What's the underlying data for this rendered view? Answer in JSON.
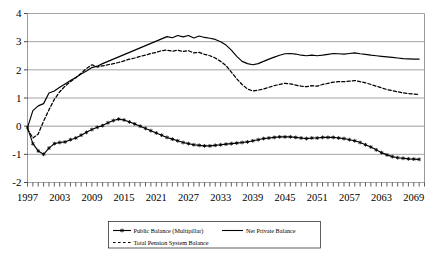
{
  "chart_data": {
    "type": "line",
    "title": "",
    "subtitle": "",
    "xlabel": "",
    "ylabel": "",
    "xlim": [
      1997,
      2071
    ],
    "ylim": [
      -2,
      4
    ],
    "yticks": [
      -2,
      -1,
      0,
      1,
      2,
      3,
      4
    ],
    "ytick_labels": [
      "-2",
      "-1",
      "0",
      "1",
      "2",
      "3",
      "4"
    ],
    "xticks": [
      1997,
      2003,
      2009,
      2015,
      2021,
      2027,
      2033,
      2039,
      2045,
      2051,
      2057,
      2063,
      2069
    ],
    "xtick_labels": [
      "1997",
      "2003",
      "2009",
      "2015",
      "2021",
      "2027",
      "2033",
      "2039",
      "2045",
      "2051",
      "2057",
      "2063",
      "2069"
    ],
    "minor_xticks_every": 1,
    "grid": true,
    "gridlines": "horizontal",
    "legend_position": "bottom",
    "x": [
      1997,
      1998,
      1999,
      2000,
      2001,
      2002,
      2003,
      2004,
      2005,
      2006,
      2007,
      2008,
      2009,
      2010,
      2011,
      2012,
      2013,
      2014,
      2015,
      2016,
      2017,
      2018,
      2019,
      2020,
      2021,
      2022,
      2023,
      2024,
      2025,
      2026,
      2027,
      2028,
      2029,
      2030,
      2031,
      2032,
      2033,
      2034,
      2035,
      2036,
      2037,
      2038,
      2039,
      2040,
      2041,
      2042,
      2043,
      2044,
      2045,
      2046,
      2047,
      2048,
      2049,
      2050,
      2051,
      2052,
      2053,
      2054,
      2055,
      2056,
      2057,
      2058,
      2059,
      2060,
      2061,
      2062,
      2063,
      2064,
      2065,
      2066,
      2067,
      2068,
      2069,
      2070
    ],
    "series": [
      {
        "name": "Net Private Balance",
        "style": "solid",
        "marker": "none",
        "color": "#000000",
        "values": [
          -0.05,
          0.55,
          0.72,
          0.8,
          1.18,
          1.25,
          1.38,
          1.5,
          1.62,
          1.73,
          1.85,
          1.96,
          2.08,
          2.13,
          2.22,
          2.3,
          2.38,
          2.46,
          2.54,
          2.62,
          2.7,
          2.78,
          2.86,
          2.94,
          3.02,
          3.1,
          3.18,
          3.14,
          3.22,
          3.17,
          3.22,
          3.13,
          3.2,
          3.15,
          3.12,
          3.08,
          3.0,
          2.88,
          2.7,
          2.48,
          2.3,
          2.22,
          2.18,
          2.22,
          2.3,
          2.38,
          2.45,
          2.52,
          2.57,
          2.58,
          2.56,
          2.52,
          2.5,
          2.52,
          2.5,
          2.52,
          2.55,
          2.58,
          2.57,
          2.56,
          2.58,
          2.6,
          2.57,
          2.55,
          2.52,
          2.5,
          2.48,
          2.46,
          2.44,
          2.42,
          2.4,
          2.39,
          2.38,
          2.38
        ]
      },
      {
        "name": "Total Pension System Balance",
        "style": "dashed",
        "marker": "none",
        "color": "#000000",
        "values": [
          -0.1,
          -0.42,
          -0.28,
          0.18,
          0.58,
          0.95,
          1.22,
          1.42,
          1.58,
          1.72,
          1.88,
          2.05,
          2.18,
          2.1,
          2.14,
          2.18,
          2.22,
          2.26,
          2.32,
          2.38,
          2.42,
          2.48,
          2.52,
          2.58,
          2.62,
          2.68,
          2.7,
          2.66,
          2.7,
          2.65,
          2.68,
          2.6,
          2.62,
          2.55,
          2.5,
          2.42,
          2.3,
          2.15,
          1.92,
          1.68,
          1.48,
          1.32,
          1.25,
          1.28,
          1.32,
          1.38,
          1.44,
          1.48,
          1.52,
          1.5,
          1.46,
          1.42,
          1.4,
          1.44,
          1.42,
          1.48,
          1.52,
          1.56,
          1.58,
          1.58,
          1.6,
          1.62,
          1.58,
          1.54,
          1.48,
          1.42,
          1.36,
          1.3,
          1.26,
          1.22,
          1.18,
          1.16,
          1.14,
          1.12
        ]
      },
      {
        "name": "Public Balance (Multipillar)",
        "style": "solid",
        "marker": "star",
        "color": "#000000",
        "values": [
          -0.05,
          -0.62,
          -0.88,
          -1.0,
          -0.78,
          -0.62,
          -0.58,
          -0.56,
          -0.48,
          -0.42,
          -0.32,
          -0.22,
          -0.12,
          -0.04,
          0.02,
          0.12,
          0.2,
          0.25,
          0.22,
          0.15,
          0.08,
          0.0,
          -0.08,
          -0.16,
          -0.24,
          -0.32,
          -0.4,
          -0.46,
          -0.52,
          -0.58,
          -0.62,
          -0.66,
          -0.68,
          -0.7,
          -0.7,
          -0.68,
          -0.66,
          -0.64,
          -0.62,
          -0.6,
          -0.58,
          -0.56,
          -0.52,
          -0.48,
          -0.44,
          -0.42,
          -0.4,
          -0.38,
          -0.38,
          -0.38,
          -0.4,
          -0.42,
          -0.44,
          -0.42,
          -0.42,
          -0.4,
          -0.4,
          -0.4,
          -0.42,
          -0.44,
          -0.48,
          -0.52,
          -0.58,
          -0.66,
          -0.74,
          -0.84,
          -0.94,
          -1.02,
          -1.08,
          -1.12,
          -1.14,
          -1.16,
          -1.17,
          -1.18
        ]
      }
    ],
    "legend": [
      {
        "label": "Public Balance (Multipillar)",
        "style": "solid",
        "marker": "star"
      },
      {
        "label": "Net Private Balance",
        "style": "solid",
        "marker": "none"
      },
      {
        "label": "Total Pension System Balance",
        "style": "dashed",
        "marker": "dot"
      }
    ],
    "colors": {
      "line": "#000000",
      "axis": "#9a9a9a",
      "grid": "#9a9a9a",
      "background": "#ffffff"
    }
  }
}
